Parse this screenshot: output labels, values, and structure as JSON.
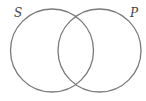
{
  "diagram": {
    "type": "venn",
    "sets": [
      {
        "label": "S",
        "cx": 52,
        "cy": 50.5,
        "r": 41.5
      },
      {
        "label": "P",
        "cx": 99.5,
        "cy": 50.5,
        "r": 41.5
      }
    ],
    "stroke_color": "#7a7a7a",
    "stroke_width": 1.3,
    "background": "#ffffff"
  }
}
